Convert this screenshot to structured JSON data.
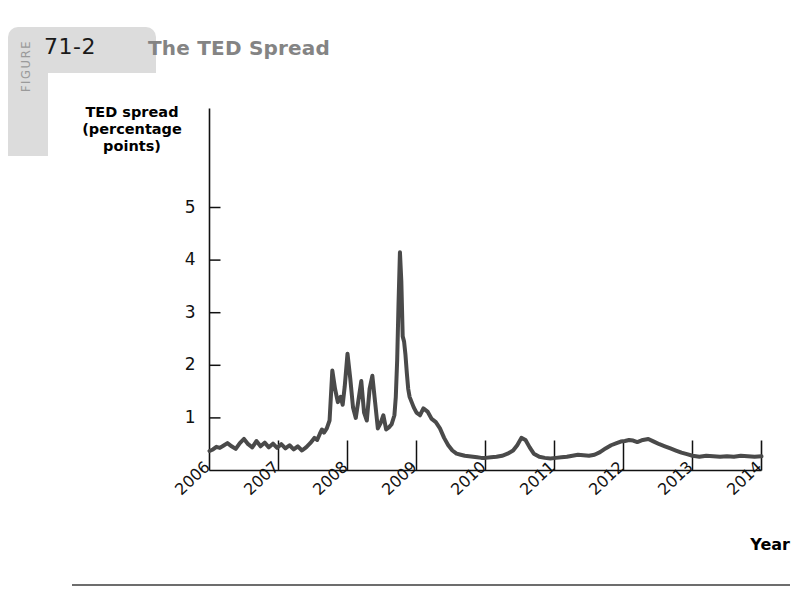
{
  "figure": {
    "kicker": "FIGURE",
    "number": "71-2",
    "title": "The TED Spread"
  },
  "chart_data": {
    "type": "line",
    "title": "The TED Spread",
    "xlabel": "Year",
    "ylabel": "TED spread (percentage points)",
    "ylabel_lines": [
      "TED spread",
      "(percentage",
      "points)"
    ],
    "xlim": [
      2006,
      2014
    ],
    "ylim": [
      0,
      5.6
    ],
    "xticks": [
      "2006",
      "2007",
      "2008",
      "2009",
      "2010",
      "2011",
      "2012",
      "2013",
      "2014"
    ],
    "yticks": [
      "1",
      "2",
      "3",
      "4",
      "5"
    ],
    "grid": false,
    "legend": "none",
    "line_color": "#4a4a4a",
    "line_width": 4,
    "series": [
      {
        "name": "TED spread",
        "x": [
          2006.0,
          2006.05,
          2006.1,
          2006.15,
          2006.2,
          2006.26,
          2006.32,
          2006.38,
          2006.44,
          2006.5,
          2006.56,
          2006.62,
          2006.68,
          2006.74,
          2006.8,
          2006.86,
          2006.92,
          2006.98,
          2007.04,
          2007.1,
          2007.16,
          2007.22,
          2007.28,
          2007.34,
          2007.4,
          2007.46,
          2007.52,
          2007.56,
          2007.6,
          2007.63,
          2007.66,
          2007.7,
          2007.74,
          2007.78,
          2007.82,
          2007.86,
          2007.9,
          2007.93,
          2007.96,
          2008.0,
          2008.04,
          2008.08,
          2008.12,
          2008.16,
          2008.2,
          2008.24,
          2008.28,
          2008.32,
          2008.36,
          2008.4,
          2008.44,
          2008.48,
          2008.52,
          2008.56,
          2008.6,
          2008.64,
          2008.68,
          2008.7,
          2008.72,
          2008.74,
          2008.76,
          2008.78,
          2008.8,
          2008.82,
          2008.84,
          2008.86,
          2008.88,
          2008.9,
          2008.93,
          2008.96,
          2009.0,
          2009.05,
          2009.1,
          2009.16,
          2009.22,
          2009.28,
          2009.34,
          2009.4,
          2009.46,
          2009.52,
          2009.58,
          2009.64,
          2009.7,
          2009.76,
          2009.82,
          2009.88,
          2009.94,
          2010.0,
          2010.08,
          2010.16,
          2010.24,
          2010.32,
          2010.4,
          2010.46,
          2010.52,
          2010.58,
          2010.64,
          2010.7,
          2010.78,
          2010.86,
          2010.94,
          2011.02,
          2011.1,
          2011.18,
          2011.26,
          2011.34,
          2011.42,
          2011.5,
          2011.58,
          2011.66,
          2011.74,
          2011.82,
          2011.9,
          2011.96,
          2012.02,
          2012.08,
          2012.14,
          2012.2,
          2012.28,
          2012.36,
          2012.44,
          2012.52,
          2012.6,
          2012.68,
          2012.76,
          2012.84,
          2012.92,
          2013.0,
          2013.1,
          2013.2,
          2013.3,
          2013.4,
          2013.5,
          2013.6,
          2013.7,
          2013.8,
          2013.9,
          2014.0
        ],
        "y": [
          0.37,
          0.4,
          0.45,
          0.43,
          0.47,
          0.52,
          0.46,
          0.41,
          0.52,
          0.6,
          0.5,
          0.44,
          0.56,
          0.46,
          0.53,
          0.44,
          0.51,
          0.43,
          0.5,
          0.42,
          0.48,
          0.4,
          0.46,
          0.38,
          0.44,
          0.52,
          0.62,
          0.58,
          0.7,
          0.78,
          0.72,
          0.8,
          0.95,
          1.9,
          1.55,
          1.3,
          1.4,
          1.25,
          1.6,
          2.22,
          1.75,
          1.2,
          1.0,
          1.35,
          1.7,
          1.1,
          0.95,
          1.55,
          1.8,
          1.3,
          0.8,
          0.9,
          1.05,
          0.78,
          0.82,
          0.88,
          1.05,
          1.4,
          2.1,
          3.2,
          4.15,
          3.6,
          2.55,
          2.45,
          2.2,
          1.85,
          1.55,
          1.4,
          1.3,
          1.2,
          1.1,
          1.05,
          1.18,
          1.12,
          0.98,
          0.92,
          0.8,
          0.62,
          0.48,
          0.38,
          0.32,
          0.3,
          0.28,
          0.27,
          0.26,
          0.25,
          0.24,
          0.24,
          0.25,
          0.26,
          0.28,
          0.32,
          0.38,
          0.48,
          0.62,
          0.58,
          0.44,
          0.32,
          0.26,
          0.24,
          0.23,
          0.24,
          0.25,
          0.26,
          0.28,
          0.3,
          0.29,
          0.28,
          0.3,
          0.35,
          0.42,
          0.48,
          0.52,
          0.55,
          0.56,
          0.58,
          0.57,
          0.54,
          0.58,
          0.6,
          0.55,
          0.5,
          0.46,
          0.42,
          0.38,
          0.34,
          0.31,
          0.28,
          0.26,
          0.28,
          0.27,
          0.26,
          0.27,
          0.26,
          0.28,
          0.27,
          0.26,
          0.27
        ]
      }
    ],
    "annotations": [
      {
        "label": "peak",
        "x": 2008.76,
        "y": 4.15
      }
    ]
  }
}
